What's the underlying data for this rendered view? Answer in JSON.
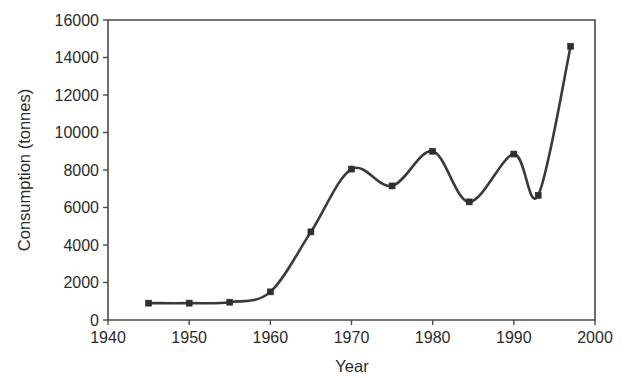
{
  "chart_data": {
    "type": "line",
    "title": "",
    "subtitle": "",
    "xlabel": "Year",
    "ylabel": "Consumption (tonnes)",
    "xlim": [
      1940,
      2000
    ],
    "ylim": [
      0,
      16000
    ],
    "xticks": [
      1940,
      1950,
      1960,
      1970,
      1980,
      1990,
      2000
    ],
    "xtick_labels": [
      "1940",
      "1950",
      "1960",
      "1970",
      "1980",
      "1990",
      "2000"
    ],
    "yticks": [
      0,
      2000,
      4000,
      6000,
      8000,
      10000,
      12000,
      14000,
      16000
    ],
    "ytick_labels": [
      "0",
      "2000",
      "4000",
      "6000",
      "8000",
      "10000",
      "12000",
      "14000",
      "16000"
    ],
    "grid": false,
    "legend": false,
    "legend_position": "none",
    "marker": "square",
    "line_color": "#3a3a3a",
    "marker_color": "#2e2e2e",
    "axis_color": "#4a4a4a",
    "background_color": "#ffffff",
    "smoothing": "spline",
    "series": [
      {
        "name": "Consumption",
        "x": [
          1945,
          1950,
          1955,
          1960,
          1965,
          1970,
          1975,
          1980,
          1984.5,
          1990,
          1993,
          1997
        ],
        "values": [
          900,
          900,
          950,
          1500,
          4700,
          8050,
          7150,
          9000,
          6300,
          8850,
          6650,
          14600
        ]
      }
    ]
  }
}
